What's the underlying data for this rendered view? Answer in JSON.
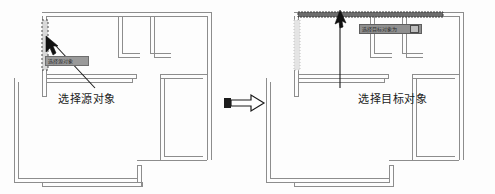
{
  "figure": {
    "background": "#fdfdfd",
    "wall_color": "#8d8d8d",
    "highlight_color": "#555555",
    "dim_color": "#c2c2c2"
  },
  "panels": [
    {
      "id": "source",
      "caption": "选择源对象",
      "tooltip": "选择源对象",
      "cursor": {
        "x": 52,
        "y": 42
      },
      "highlighted_element": "left-vertical-wall"
    },
    {
      "id": "target",
      "caption": "选择目标对象",
      "tooltip": "选择目标对象为",
      "tooltip_badge": "U",
      "cursor": {
        "x": 338,
        "y": 22
      },
      "highlighted_element": "top-horizontal-wall"
    }
  ],
  "transition_arrow": {
    "name": "right-arrow",
    "direction": "right"
  }
}
